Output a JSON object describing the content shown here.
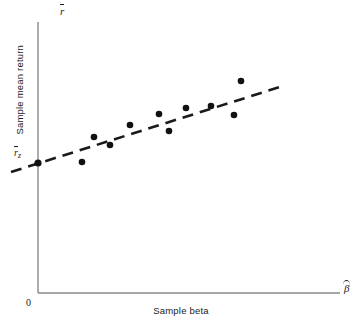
{
  "figure": {
    "background_color": "#ffffff",
    "axis_color": "#8a8a8a",
    "point_color": "#111111",
    "line_color": "#1a1a1a"
  },
  "labels": {
    "y_axis_symbol": "r",
    "y_axis_symbol_decoration": "overbar",
    "x_axis_symbol": "β",
    "x_axis_symbol_decoration": "hat",
    "y_axis_caption": "Sample mean return",
    "x_axis_caption": "Sample beta",
    "origin": "0",
    "intercept_symbol": "r",
    "intercept_subscript": "z",
    "intercept_decoration": "overbar"
  },
  "chart_data": {
    "type": "scatter",
    "title": "",
    "subtitle": "",
    "xlabel": "Sample beta",
    "ylabel": "Sample mean return",
    "xlim": [
      0,
      1
    ],
    "ylim": [
      0,
      1
    ],
    "grid": false,
    "legend": false,
    "legend_position": "none",
    "x_axis_tick_labels": [
      "0"
    ],
    "y_axis_tick_labels": [
      "r̄z"
    ],
    "annotations": [
      {
        "text": "r̄",
        "position": "y-axis-top",
        "meaning": "sample mean return axis variable"
      },
      {
        "text": "β̂",
        "position": "x-axis-right",
        "meaning": "estimated sample beta axis variable"
      },
      {
        "text": "r̄z",
        "position": "y-axis-intercept",
        "meaning": "zero-beta portfolio sample mean return (intercept)"
      },
      {
        "text": "0",
        "position": "origin",
        "meaning": "origin"
      }
    ],
    "series": [
      {
        "name": "Observed portfolios",
        "type": "scatter",
        "marker": "filled-circle",
        "color": "#111111",
        "points": [
          {
            "px": 82,
            "py": 162
          },
          {
            "px": 94,
            "py": 137
          },
          {
            "px": 110,
            "py": 145
          },
          {
            "px": 130,
            "py": 125
          },
          {
            "px": 159,
            "py": 114
          },
          {
            "px": 169,
            "py": 131
          },
          {
            "px": 186,
            "py": 108
          },
          {
            "px": 211,
            "py": 106
          },
          {
            "px": 234,
            "py": 115
          },
          {
            "px": 241,
            "py": 81
          }
        ]
      },
      {
        "name": "Fitted empirical security market line",
        "type": "line",
        "style": "dashed",
        "color": "#1a1a1a",
        "endpoints": [
          {
            "px": 11,
            "py": 172
          },
          {
            "px": 283,
            "py": 86
          }
        ]
      },
      {
        "name": "Intercept marker",
        "type": "scatter",
        "marker": "filled-circle",
        "color": "#111111",
        "points": [
          {
            "px": 38,
            "py": 163
          }
        ]
      }
    ],
    "axes_geometry": {
      "y_axis_x": 38,
      "y_axis_top": 22,
      "y_axis_bottom": 293,
      "x_axis_y": 293,
      "x_axis_right": 340
    }
  }
}
